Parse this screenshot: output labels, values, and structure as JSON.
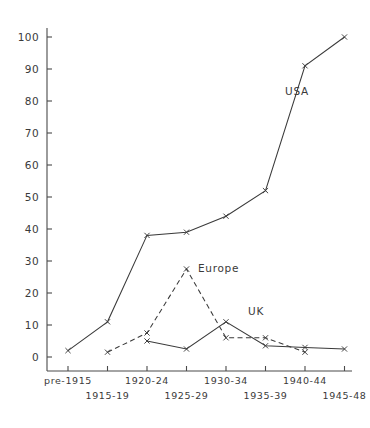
{
  "chart_data": {
    "type": "line",
    "title": "",
    "subtitle": "",
    "xlabel": "",
    "ylabel": "",
    "categories": [
      "pre-1915",
      "1915-19",
      "1920-24",
      "1925-29",
      "1930-34",
      "1935-39",
      "1940-44",
      "1945-48"
    ],
    "ylim": [
      0,
      100
    ],
    "yticks": [
      0,
      10,
      20,
      30,
      40,
      50,
      60,
      70,
      80,
      90,
      100
    ],
    "ytick_labels": [
      "0",
      "10",
      "20",
      "30",
      "40",
      "50",
      "60",
      "70",
      "80",
      "90",
      "100"
    ],
    "grid": false,
    "legend": "inline-annotations",
    "xtick_stagger": true,
    "series": [
      {
        "name": "USA",
        "style": "solid",
        "marker": "x",
        "label_position": {
          "x": 285,
          "y": 95
        },
        "values": [
          2,
          11,
          38,
          39,
          44,
          52,
          91,
          100
        ]
      },
      {
        "name": "Europe",
        "style": "dashed",
        "marker": "x",
        "label_position": {
          "x": 198,
          "y": 272
        },
        "values": [
          null,
          1.5,
          7.5,
          27.5,
          6,
          6,
          1.5,
          null
        ]
      },
      {
        "name": "UK",
        "style": "solid",
        "marker": "x",
        "label_position": {
          "x": 248,
          "y": 315
        },
        "values": [
          null,
          null,
          5,
          2.5,
          11,
          3.5,
          3,
          2.5
        ]
      }
    ],
    "annotations": [
      {
        "text": "USA",
        "series": "USA"
      },
      {
        "text": "Europe",
        "series": "Europe"
      },
      {
        "text": "UK",
        "series": "UK"
      }
    ]
  }
}
